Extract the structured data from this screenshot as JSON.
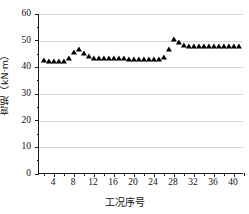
{
  "chart_data": {
    "type": "scatter",
    "title": "",
    "xlabel": "工况序号",
    "ylabel": "弯矩（kN·m）",
    "xlim": [
      1,
      42
    ],
    "ylim": [
      0,
      60
    ],
    "grid": true,
    "legend": null,
    "marker": "triangle-up",
    "marker_color": "#000000",
    "xticks": [
      4,
      8,
      12,
      16,
      20,
      24,
      28,
      32,
      36,
      40
    ],
    "xtick_minor_step": 2,
    "yticks": [
      0,
      10,
      20,
      30,
      40,
      50,
      60
    ],
    "ytick_minor_step": 5,
    "x": [
      2,
      3,
      4,
      5,
      6,
      7,
      8,
      9,
      10,
      11,
      12,
      13,
      14,
      15,
      16,
      17,
      18,
      19,
      20,
      21,
      22,
      23,
      24,
      25,
      26,
      27,
      28,
      29,
      30,
      31,
      32,
      33,
      34,
      35,
      36,
      37,
      38,
      39,
      40,
      41
    ],
    "values": [
      42.3,
      42.0,
      42.0,
      42.0,
      42.0,
      43.2,
      45.3,
      46.5,
      44.9,
      43.8,
      43.3,
      43.1,
      43.0,
      43.0,
      43.0,
      43.0,
      43.0,
      42.9,
      42.9,
      42.9,
      42.9,
      42.9,
      42.9,
      42.9,
      43.4,
      46.5,
      50.1,
      49.2,
      48.0,
      47.8,
      47.7,
      47.7,
      47.7,
      47.7,
      47.7,
      47.7,
      47.7,
      47.7,
      47.7,
      47.6
    ]
  },
  "axes": {
    "y_tick_labels": [
      "0",
      "10",
      "20",
      "30",
      "40",
      "50",
      "60"
    ],
    "x_tick_labels": [
      "4",
      "8",
      "12",
      "16",
      "20",
      "24",
      "28",
      "32",
      "36",
      "40"
    ]
  }
}
